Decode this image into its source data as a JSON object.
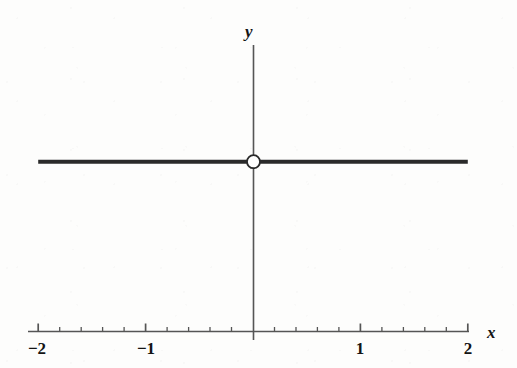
{
  "figure": {
    "background_color": "#fdfdfc",
    "ink_color": "#2a2a2a",
    "axis_color": "#555555",
    "label_color": "#141414"
  },
  "axes": {
    "x_label": "x",
    "y_label": "y",
    "x_ticks": [
      {
        "value": -2,
        "label": "−2",
        "px": 37
      },
      {
        "value": -1,
        "label": "−1",
        "px": 146
      },
      {
        "value": 0,
        "label": "",
        "px": 253
      },
      {
        "value": 1,
        "label": "1",
        "px": 360
      },
      {
        "value": 2,
        "label": "2",
        "px": 468
      }
    ],
    "minor_tick_step": 0.2,
    "x_axis_y_px": 331,
    "y_axis_x_px": 253,
    "y_axis_top_px": 45,
    "y_axis_bottom_px": 340,
    "px_per_unit": 107.4
  },
  "chart_data": {
    "type": "line",
    "title": "",
    "subtitle": "",
    "xlabel": "x",
    "ylabel": "y",
    "xlim": [
      -2,
      2
    ],
    "ylim": [
      -1.4,
      3.1
    ],
    "grid": false,
    "legend": "none",
    "xticks": [
      -2,
      -1,
      0,
      1,
      2
    ],
    "xticklabels": [
      "−2",
      "−1",
      "",
      "1",
      "2"
    ],
    "yticks": [],
    "yticklabels": [],
    "minor_tick_step": 0.2,
    "series": [
      {
        "name": "constant function with removable discontinuity",
        "type": "line",
        "description": "horizontal line y = 1.32 drawn from x = -2 to x = 2",
        "x": [
          -2,
          2
        ],
        "values": [
          1.32,
          1.32
        ],
        "constant_y": 1.32,
        "linewidth_px": 4,
        "color": "#2a2a2a"
      }
    ],
    "markers": [
      {
        "name": "open-circle-hole",
        "style": "open",
        "x": 0,
        "y": 1.32,
        "radius_px": 6.5,
        "fill": "#ffffff",
        "edge_color": "#2a2a2a",
        "note": "removable discontinuity at the origin-x value"
      }
    ],
    "annotations": []
  }
}
